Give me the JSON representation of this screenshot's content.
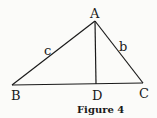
{
  "figure": {
    "caption": "Figure 4",
    "vertices": {
      "A": {
        "label": "A",
        "x": 95,
        "y": 21
      },
      "B": {
        "label": "B",
        "x": 12,
        "y": 85
      },
      "C": {
        "label": "C",
        "x": 143,
        "y": 83
      },
      "D": {
        "label": "D",
        "x": 96,
        "y": 84
      }
    },
    "sides": {
      "c": {
        "label": "c"
      },
      "b": {
        "label": "b"
      }
    },
    "colors": {
      "ink": "#1a1a1a",
      "paper": "#fbfbf9"
    }
  }
}
